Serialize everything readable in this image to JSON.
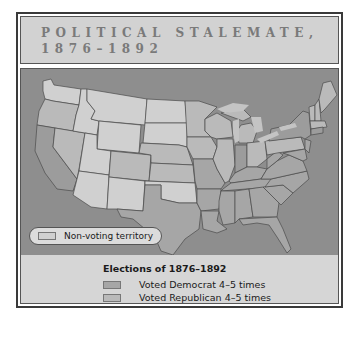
{
  "title": {
    "line1": "POLITICAL STALEMATE,",
    "line2": "1876–1892"
  },
  "map": {
    "colors": {
      "ocean": "#8e8e8e",
      "non_voting": "#d0d0d0",
      "democrat": "#a6a6a6",
      "republican": "#bababa",
      "irregular": "#9c9c9c",
      "border": "#4a4a4a"
    },
    "non_voting_label": "Non-voting territory"
  },
  "legend": {
    "title": "Elections of 1876–1892",
    "items": [
      {
        "label": "Voted Democrat 4–5 times",
        "color": "#a6a6a6"
      },
      {
        "label": "Voted Republican 4–5 times",
        "color": "#bababa"
      },
      {
        "label": "Voted more irregularly",
        "color": "#9c9c9c"
      }
    ]
  }
}
